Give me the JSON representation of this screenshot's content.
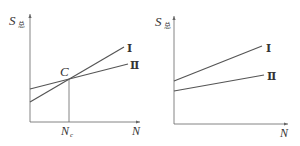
{
  "diagrams": [
    {
      "id": "left",
      "y_axis_label": "S",
      "y_axis_subscript": "总",
      "x_axis_label": "N",
      "intersection_label": "C",
      "x_marker_label": "N",
      "x_marker_subscript": "c",
      "line_labels": [
        "Ⅰ",
        "Ⅱ"
      ]
    },
    {
      "id": "right",
      "y_axis_label": "S",
      "y_axis_subscript": "总",
      "x_axis_label": "N",
      "line_labels": [
        "Ⅰ",
        "Ⅱ"
      ]
    }
  ],
  "colors": {
    "line": "#555555",
    "axis": "#666666",
    "text": "#333333"
  }
}
